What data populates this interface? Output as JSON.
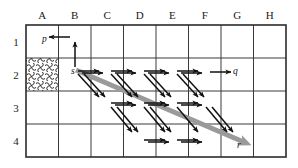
{
  "figure": {
    "type": "grid-diagram",
    "title": "",
    "grid": {
      "columns": [
        "A",
        "B",
        "C",
        "D",
        "E",
        "F",
        "G",
        "H"
      ],
      "rows": [
        "1",
        "2",
        "3",
        "4"
      ],
      "left": 26,
      "top": 25,
      "right": 286,
      "bottom": 157,
      "col_width": 32.5,
      "row_height": 33,
      "line_color": "#3a3a3a",
      "border_color": "#2b2b2b"
    },
    "blocked_cells": [
      {
        "col": "A",
        "row": "2",
        "pattern": "cross-hatch"
      }
    ],
    "node_labels": [
      {
        "id": "p",
        "text": "p",
        "col": "A",
        "row": "1",
        "x": 42,
        "y": 42
      },
      {
        "id": "s",
        "text": "s",
        "col": "B",
        "row": "2",
        "x": 71,
        "y": 74
      },
      {
        "id": "q",
        "text": "q",
        "col": "G",
        "row": "2",
        "x": 233,
        "y": 74
      },
      {
        "id": "r",
        "text": "r",
        "col": "G",
        "row": "4",
        "x": 237,
        "y": 148
      }
    ],
    "thick_arrow": {
      "label": "shortcut-path",
      "color": "#9a9a9a",
      "width": 5,
      "from_x": 76,
      "from_y": 70,
      "to_x": 246,
      "to_y": 143
    },
    "arrows": {
      "color": "#111111",
      "head_style": "solid-triangle",
      "horizontal_row1": [
        {
          "x1": 70,
          "y1": 37,
          "x2": 49,
          "y2": 37
        }
      ],
      "vertical_up": [
        {
          "x1": 75,
          "y1": 67,
          "x2": 75,
          "y2": 42
        }
      ],
      "horizontal_row2": [
        {
          "x1": 78,
          "y1": 71,
          "x2": 99,
          "y2": 71
        },
        {
          "x1": 82,
          "y1": 73,
          "x2": 103,
          "y2": 73
        },
        {
          "x1": 111,
          "y1": 71,
          "x2": 132,
          "y2": 71
        },
        {
          "x1": 115,
          "y1": 73,
          "x2": 136,
          "y2": 73
        },
        {
          "x1": 144,
          "y1": 71,
          "x2": 165,
          "y2": 71
        },
        {
          "x1": 148,
          "y1": 73,
          "x2": 169,
          "y2": 73
        },
        {
          "x1": 177,
          "y1": 71,
          "x2": 198,
          "y2": 71
        },
        {
          "x1": 181,
          "y1": 73,
          "x2": 202,
          "y2": 73
        },
        {
          "x1": 210,
          "y1": 72,
          "x2": 231,
          "y2": 72
        }
      ],
      "horizontal_row3": [
        {
          "x1": 111,
          "y1": 103,
          "x2": 132,
          "y2": 103
        },
        {
          "x1": 115,
          "y1": 105,
          "x2": 136,
          "y2": 105
        },
        {
          "x1": 144,
          "y1": 103,
          "x2": 165,
          "y2": 103
        },
        {
          "x1": 148,
          "y1": 105,
          "x2": 169,
          "y2": 105
        },
        {
          "x1": 177,
          "y1": 103,
          "x2": 198,
          "y2": 103
        },
        {
          "x1": 181,
          "y1": 105,
          "x2": 202,
          "y2": 105
        }
      ],
      "horizontal_row4": [
        {
          "x1": 144,
          "y1": 140,
          "x2": 165,
          "y2": 140
        },
        {
          "x1": 148,
          "y1": 142,
          "x2": 169,
          "y2": 142
        },
        {
          "x1": 177,
          "y1": 140,
          "x2": 198,
          "y2": 140
        },
        {
          "x1": 181,
          "y1": 142,
          "x2": 202,
          "y2": 142
        }
      ],
      "diagonal_down": [
        {
          "x1": 78,
          "y1": 74,
          "x2": 99,
          "y2": 97
        },
        {
          "x1": 84,
          "y1": 74,
          "x2": 105,
          "y2": 97
        },
        {
          "x1": 111,
          "y1": 74,
          "x2": 132,
          "y2": 97
        },
        {
          "x1": 117,
          "y1": 74,
          "x2": 138,
          "y2": 97
        },
        {
          "x1": 144,
          "y1": 74,
          "x2": 165,
          "y2": 97
        },
        {
          "x1": 150,
          "y1": 74,
          "x2": 171,
          "y2": 97
        },
        {
          "x1": 177,
          "y1": 74,
          "x2": 198,
          "y2": 97
        },
        {
          "x1": 183,
          "y1": 74,
          "x2": 204,
          "y2": 97
        },
        {
          "x1": 111,
          "y1": 107,
          "x2": 132,
          "y2": 132
        },
        {
          "x1": 117,
          "y1": 107,
          "x2": 138,
          "y2": 132
        },
        {
          "x1": 144,
          "y1": 107,
          "x2": 165,
          "y2": 132
        },
        {
          "x1": 150,
          "y1": 107,
          "x2": 171,
          "y2": 132
        },
        {
          "x1": 177,
          "y1": 107,
          "x2": 198,
          "y2": 132
        },
        {
          "x1": 206,
          "y1": 107,
          "x2": 227,
          "y2": 132
        },
        {
          "x1": 212,
          "y1": 107,
          "x2": 233,
          "y2": 132
        }
      ]
    }
  },
  "chart_data": {
    "type": "diagram",
    "columns": [
      "A",
      "B",
      "C",
      "D",
      "E",
      "F",
      "G",
      "H"
    ],
    "rows": [
      1,
      2,
      3,
      4
    ],
    "labels": [
      "p",
      "s",
      "q",
      "r"
    ],
    "blocked": [
      "A2"
    ]
  }
}
